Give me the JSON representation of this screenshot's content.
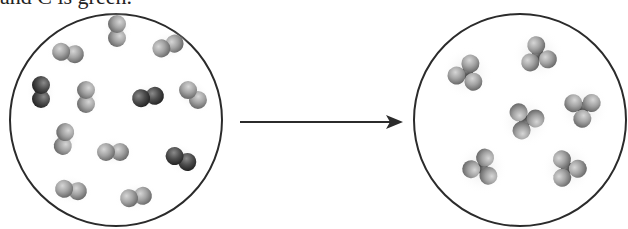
{
  "caption": {
    "text": "and C is green."
  },
  "colors": {
    "background": "#ffffff",
    "circle_stroke": "#2b2b2b",
    "light_atom": "#a9a9a9",
    "dark_atom": "#4a4a4a",
    "arrow": "#2b2b2b"
  },
  "reactants": {
    "label": "reactants",
    "circle": {
      "cx": 116,
      "cy": 120,
      "r": 106
    },
    "molecule_type": "diatomic",
    "counts": {
      "light_light": 9,
      "dark_dark": 3,
      "total": 12
    },
    "molecules": [
      {
        "cx": 117,
        "cy": 31,
        "angle": 90,
        "color": "light"
      },
      {
        "cx": 68,
        "cy": 53,
        "angle": 10,
        "color": "light"
      },
      {
        "cx": 168,
        "cy": 46,
        "angle": -20,
        "color": "light"
      },
      {
        "cx": 41,
        "cy": 92,
        "angle": 90,
        "color": "dark"
      },
      {
        "cx": 86,
        "cy": 97,
        "angle": 90,
        "color": "light"
      },
      {
        "cx": 148,
        "cy": 97,
        "angle": -10,
        "color": "dark"
      },
      {
        "cx": 193,
        "cy": 95,
        "angle": 45,
        "color": "light"
      },
      {
        "cx": 64,
        "cy": 139,
        "angle": 100,
        "color": "light"
      },
      {
        "cx": 113,
        "cy": 152,
        "angle": 0,
        "color": "light"
      },
      {
        "cx": 181,
        "cy": 159,
        "angle": 25,
        "color": "dark"
      },
      {
        "cx": 71,
        "cy": 190,
        "angle": 10,
        "color": "light"
      },
      {
        "cx": 136,
        "cy": 197,
        "angle": -10,
        "color": "light"
      }
    ]
  },
  "arrow": {
    "x1": 240,
    "y1": 122,
    "x2": 402,
    "y2": 122
  },
  "products": {
    "label": "products",
    "circle": {
      "cx": 520,
      "cy": 120,
      "r": 106
    },
    "molecule_type": "AB3 (one dark central atom bonded to three light atoms)",
    "counts": {
      "total": 6
    },
    "molecules": [
      {
        "cx": 467,
        "cy": 73
      },
      {
        "cx": 538,
        "cy": 55
      },
      {
        "cx": 525,
        "cy": 121
      },
      {
        "cx": 583,
        "cy": 108
      },
      {
        "cx": 482,
        "cy": 168
      },
      {
        "cx": 567,
        "cy": 168
      }
    ]
  }
}
